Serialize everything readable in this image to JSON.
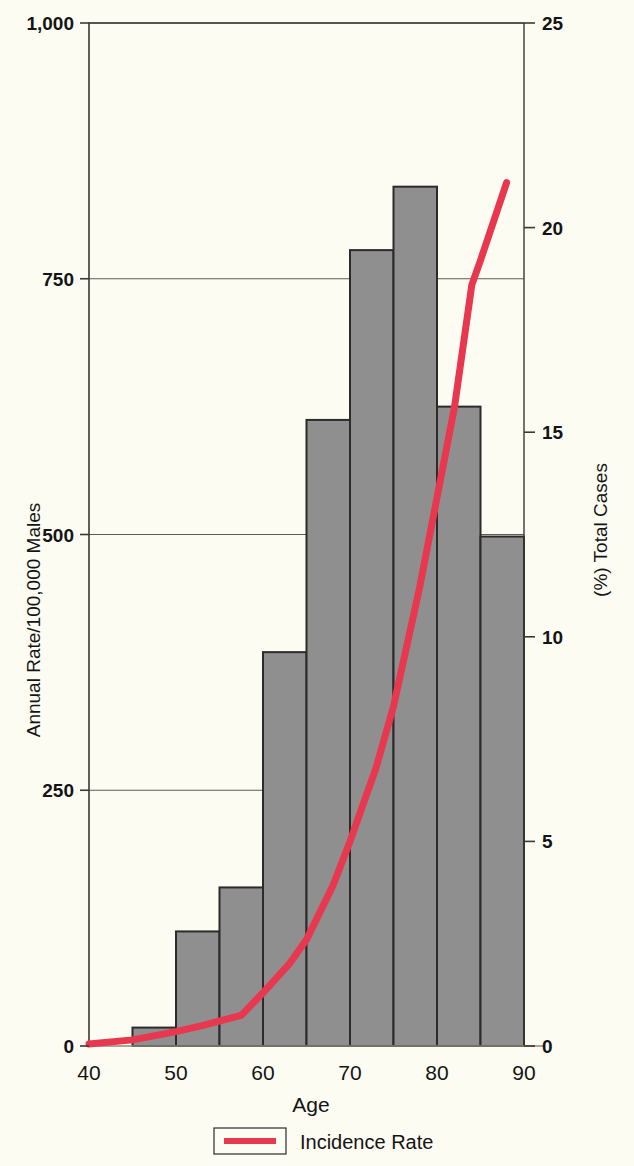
{
  "chart_data": {
    "type": "bar",
    "title": "",
    "subtitle": "",
    "xlabel": "Age",
    "ylabel": "Annual Rate/100,000 Males",
    "y2label": "(%) Total Cases",
    "xlim": [
      40,
      90
    ],
    "ylim": [
      0,
      1000
    ],
    "y2lim": [
      0,
      25
    ],
    "xticks": [
      40,
      50,
      60,
      70,
      80,
      90
    ],
    "xticklabels": [
      "40",
      "50",
      "60",
      "70",
      "80",
      "90"
    ],
    "yticks": [
      0,
      250,
      500,
      750,
      1000
    ],
    "yticklabels": [
      "0",
      "250",
      "500",
      "750",
      "1,000"
    ],
    "y2ticks": [
      0,
      5,
      10,
      15,
      20,
      25
    ],
    "y2ticklabels": [
      "0",
      "5",
      "10",
      "15",
      "20",
      "25"
    ],
    "grid": "horizontal",
    "legend_position": "bottom-center",
    "bar_color": "#8f8f8f",
    "bar_edge_color": "#2b2b2b",
    "line_color": "#e8384f",
    "categories": [
      "40-45",
      "45-50",
      "50-55",
      "55-60",
      "60-65",
      "65-70",
      "70-75",
      "75-80",
      "80-85",
      "85-90"
    ],
    "bin_edges": [
      40,
      45,
      50,
      55,
      60,
      65,
      70,
      75,
      80,
      85,
      90
    ],
    "series": [
      {
        "name": "Annual Rate/100,000 Males",
        "type": "bar",
        "axis": "left",
        "values": [
          0,
          18,
          112,
          155,
          385,
          612,
          778,
          840,
          625,
          498
        ]
      },
      {
        "name": "Incidence Rate",
        "type": "line",
        "axis": "right",
        "x": [
          40,
          45,
          50,
          53,
          57.5,
          60,
          63,
          65,
          68,
          70,
          73,
          75,
          78,
          80,
          82,
          84,
          85,
          88
        ],
        "values": [
          0.05,
          0.15,
          0.35,
          0.5,
          0.75,
          1.3,
          2.0,
          2.6,
          3.9,
          5.0,
          6.8,
          8.3,
          11.2,
          13.4,
          15.6,
          18.6,
          19.2,
          21.1
        ]
      }
    ],
    "legend": [
      {
        "label": "Incidence Rate",
        "color": "#e8384f",
        "marker": "line"
      }
    ]
  },
  "labels": {
    "y_axis_title": "Annual Rate/100,000 Males",
    "y2_axis_title": "(%) Total Cases",
    "x_axis_title": "Age",
    "legend_entry": "Incidence Rate"
  }
}
